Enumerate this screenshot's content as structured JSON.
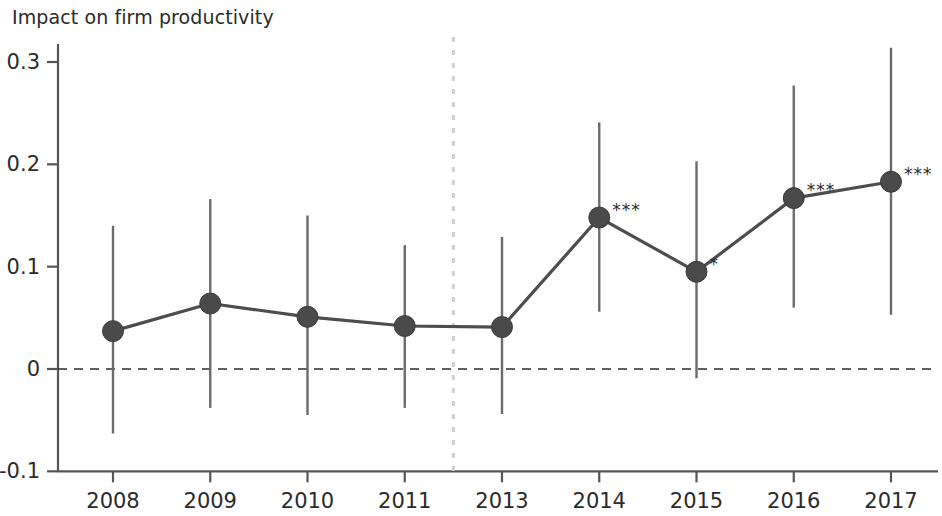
{
  "chart_data": {
    "type": "line",
    "title": "Impact on firm productivity",
    "subtitle": "",
    "xlabel": "",
    "ylabel": "",
    "categories": [
      "2008",
      "2009",
      "2010",
      "2011",
      "2013",
      "2014",
      "2015",
      "2016",
      "2017"
    ],
    "values": [
      0.037,
      0.064,
      0.051,
      0.042,
      0.041,
      0.148,
      0.095,
      0.167,
      0.183
    ],
    "error_low": [
      -0.063,
      -0.038,
      -0.045,
      -0.038,
      -0.044,
      0.056,
      -0.009,
      0.06,
      0.053
    ],
    "error_high": [
      0.14,
      0.166,
      0.15,
      0.121,
      0.129,
      0.241,
      0.203,
      0.277,
      0.314
    ],
    "significance": [
      "",
      "",
      "",
      "",
      "",
      "***",
      "*",
      "***",
      "***"
    ],
    "yticks": [
      "0.3",
      "0.2",
      "0.1",
      "0",
      "-0.1"
    ],
    "ytick_values": [
      0.3,
      0.2,
      0.1,
      0,
      -0.1
    ],
    "ylim": [
      -0.1,
      0.32
    ],
    "grid": false,
    "legend": "none",
    "zero_reference_line": true,
    "vertical_reference_line": {
      "position_between": [
        "2011",
        "2013"
      ],
      "label": "",
      "style": "dotted"
    },
    "colors": {
      "marker": "#4a4a4a",
      "line": "#4d4d4d",
      "errorbar": "#6b6b6b",
      "axis": "#555555",
      "zero_line": "#2b2b2b",
      "reference_line": "#cfcfcf",
      "text": "#2b2b2b",
      "background": "#ffffff"
    }
  }
}
